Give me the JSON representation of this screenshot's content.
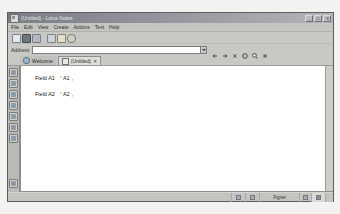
{
  "window": {
    "title": "(Untitled) - Lotus Notes",
    "icon": "notes-app-icon",
    "controls": [
      {
        "name": "minimize-button",
        "glyph": "_"
      },
      {
        "name": "maximize-button",
        "glyph": "□"
      },
      {
        "name": "close-button",
        "glyph": "✕"
      }
    ]
  },
  "menu": {
    "items": [
      {
        "label": "File"
      },
      {
        "label": "Edit"
      },
      {
        "label": "View"
      },
      {
        "label": "Create"
      },
      {
        "label": "Actions"
      },
      {
        "label": "Text"
      },
      {
        "label": "Help"
      }
    ]
  },
  "toolbar": {
    "buttons": [
      {
        "name": "new-memo-icon",
        "color": "#d8e2ec"
      },
      {
        "name": "save-icon",
        "color": "#8e949c"
      },
      {
        "name": "print-icon",
        "color": "#b9bec6"
      },
      {
        "name": "spell-check-icon",
        "color": "#cfd4da"
      },
      {
        "name": "copy-icon",
        "color": "#e0dcc8"
      },
      {
        "name": "paste-icon",
        "color": "#cfcfca"
      }
    ]
  },
  "address": {
    "label": "Address",
    "value": "",
    "placeholder": "",
    "dropdown_icon": "chevron-down-icon",
    "nav_buttons": [
      {
        "name": "back-icon",
        "glyph": "←"
      },
      {
        "name": "forward-icon",
        "glyph": "→"
      },
      {
        "name": "stop-icon",
        "glyph": "✕"
      },
      {
        "name": "refresh-icon",
        "glyph": "↻"
      },
      {
        "name": "search-icon",
        "glyph": "●"
      },
      {
        "name": "open-url-icon",
        "glyph": "▪"
      }
    ]
  },
  "tabs": [
    {
      "label": "Welcome",
      "icon": "welcome-globe-icon",
      "active": false,
      "closable": false
    },
    {
      "label": "(Untitled)",
      "icon": "document-icon",
      "active": true,
      "closable": true,
      "close_glyph": "✕"
    }
  ],
  "bookmark_rail": {
    "items": [
      {
        "name": "bookmark-favorites-icon"
      },
      {
        "name": "bookmark-databases-icon"
      },
      {
        "name": "bookmark-mail-icon"
      },
      {
        "name": "bookmark-calendar-icon"
      },
      {
        "name": "bookmark-contacts-icon"
      },
      {
        "name": "bookmark-todo-icon"
      },
      {
        "name": "bookmark-replication-icon"
      },
      {
        "name": "bookmark-workspace-icon"
      }
    ],
    "bottom_item": {
      "name": "bookmark-history-icon"
    }
  },
  "document": {
    "fields": [
      {
        "label": "Field A1",
        "open_marker": "⌜",
        "value": "A1",
        "close_marker": "⌟"
      },
      {
        "label": "Field A2",
        "open_marker": "⌜",
        "value": "A2",
        "close_marker": "⌟"
      }
    ]
  },
  "status_bar": {
    "message": "",
    "cells": [
      {
        "name": "status-indicator-icon",
        "label": ""
      },
      {
        "name": "status-access-icon",
        "label": ""
      }
    ],
    "network": "Fignet",
    "location_icon": "location-icon",
    "lock_icon": "lock-icon"
  },
  "colors": {
    "window_face": "#c8c8c4",
    "title_bar": "#8a8d95",
    "doc_background": "#ffffff",
    "rail": "#b9b9b5",
    "active_tab": "#dededa"
  }
}
